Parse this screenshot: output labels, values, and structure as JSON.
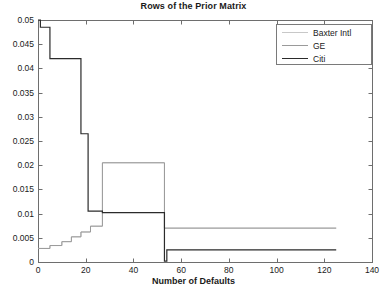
{
  "chart_data": {
    "type": "line",
    "title": "Rows of the Prior Matrix",
    "xlabel": "Number of Defaults",
    "ylabel": "",
    "xlim": [
      0,
      140
    ],
    "ylim": [
      0,
      0.05
    ],
    "xticks": [
      0,
      20,
      40,
      60,
      80,
      100,
      120,
      140
    ],
    "yticks": [
      0,
      0.005,
      0.01,
      0.015,
      0.02,
      0.025,
      0.03,
      0.035,
      0.04,
      0.045,
      0.05
    ],
    "ytick_labels": [
      "0",
      "0.005",
      "0.01",
      "0.015",
      "0.02",
      "0.025",
      "0.03",
      "0.035",
      "0.04",
      "0.045",
      "0.05"
    ],
    "xtick_labels": [
      "0",
      "20",
      "40",
      "60",
      "80",
      "100",
      "120",
      "140"
    ],
    "grid": false,
    "legend_position": "upper right",
    "drawstyle": "steps-post",
    "series": [
      {
        "name": "Baxter Intl",
        "color": "#c8c8c8",
        "width": 1,
        "points": [
          [
            0,
            0.0028
          ],
          [
            5,
            0.0028
          ],
          [
            5,
            0.0034
          ],
          [
            10,
            0.0034
          ],
          [
            10,
            0.0042
          ],
          [
            14,
            0.0042
          ],
          [
            14,
            0.0052
          ],
          [
            18,
            0.0052
          ],
          [
            18,
            0.0062
          ],
          [
            22,
            0.0062
          ],
          [
            22,
            0.0074
          ],
          [
            27,
            0.0074
          ],
          [
            27,
            0.0205
          ],
          [
            53,
            0.0205
          ],
          [
            53,
            0.007
          ],
          [
            125,
            0.007
          ]
        ]
      },
      {
        "name": "GE",
        "color": "#9a9a9a",
        "width": 1,
        "points": [
          [
            0,
            0.0028
          ],
          [
            5,
            0.0028
          ],
          [
            5,
            0.0034
          ],
          [
            10,
            0.0034
          ],
          [
            10,
            0.0042
          ],
          [
            14,
            0.0042
          ],
          [
            14,
            0.0052
          ],
          [
            18,
            0.0052
          ],
          [
            18,
            0.0062
          ],
          [
            22,
            0.0062
          ],
          [
            22,
            0.0074
          ],
          [
            27,
            0.0074
          ],
          [
            27,
            0.0205
          ],
          [
            53,
            0.0205
          ],
          [
            53,
            0.007
          ],
          [
            125,
            0.007
          ]
        ]
      },
      {
        "name": "Citi",
        "color": "#2b2b2b",
        "width": 1.2,
        "points": [
          [
            0,
            0.05
          ],
          [
            1,
            0.05
          ],
          [
            1,
            0.0485
          ],
          [
            5,
            0.0485
          ],
          [
            5,
            0.042
          ],
          [
            18,
            0.042
          ],
          [
            18,
            0.0265
          ],
          [
            21,
            0.0265
          ],
          [
            21,
            0.0105
          ],
          [
            27,
            0.0105
          ],
          [
            27,
            0.0102
          ],
          [
            53,
            0.0102
          ],
          [
            53,
            0.0002
          ],
          [
            54,
            0.0002
          ],
          [
            54,
            0.0025
          ],
          [
            125,
            0.0025
          ]
        ]
      }
    ],
    "legend": [
      {
        "label": "Baxter Intl",
        "color": "#c8c8c8"
      },
      {
        "label": "GE",
        "color": "#9a9a9a"
      },
      {
        "label": "Citi",
        "color": "#2b2b2b"
      }
    ],
    "axes_color": "#6e6e6e",
    "plot_box": {
      "left": 38,
      "top": 20,
      "right": 372,
      "bottom": 262
    }
  }
}
